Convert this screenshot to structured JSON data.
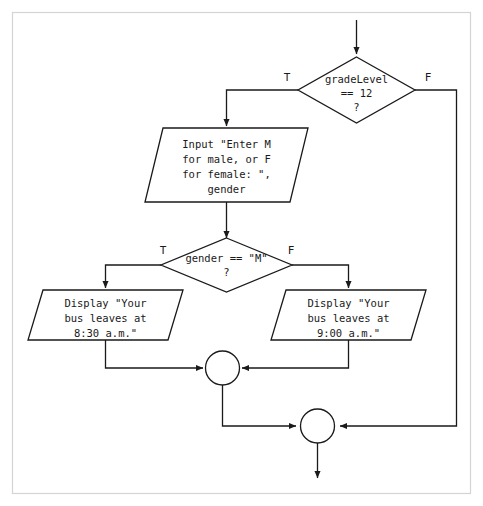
{
  "diagram": {
    "type": "flowchart",
    "frame": {
      "visible": true,
      "color": "#d4d4d4"
    },
    "colors": {
      "stroke": "#1a1a1a",
      "fill": "#ffffff",
      "frame": "#d4d4d4"
    },
    "nodes": [
      {
        "id": "entry-arrow",
        "kind": "arrow",
        "label": ""
      },
      {
        "id": "decision-grade-level",
        "kind": "decision",
        "lines": [
          "gradeLevel",
          "==  12",
          "?"
        ]
      },
      {
        "id": "input-gender",
        "kind": "input-output",
        "lines": [
          "Input \"Enter M",
          "for male, or F",
          "for female: \",",
          "gender"
        ]
      },
      {
        "id": "decision-gender",
        "kind": "decision",
        "lines": [
          "gender == \"M\"",
          "?"
        ]
      },
      {
        "id": "display-830",
        "kind": "input-output",
        "lines": [
          "Display \"Your",
          "bus leaves at",
          "8:30 a.m.\""
        ]
      },
      {
        "id": "display-900",
        "kind": "input-output",
        "lines": [
          "Display \"Your",
          "bus leaves at",
          "9:00 a.m.\""
        ]
      },
      {
        "id": "merge-connector-inner",
        "kind": "connector",
        "label": ""
      },
      {
        "id": "merge-connector-outer",
        "kind": "connector",
        "label": ""
      },
      {
        "id": "exit-arrow",
        "kind": "arrow",
        "label": ""
      }
    ],
    "branch_labels": {
      "grade_level_true": "T",
      "grade_level_false": "F",
      "gender_true": "T",
      "gender_false": "F"
    },
    "edges": [
      {
        "from": "entry-arrow",
        "to": "decision-grade-level",
        "label": ""
      },
      {
        "from": "decision-grade-level",
        "to": "input-gender",
        "label": "T"
      },
      {
        "from": "decision-grade-level",
        "to": "merge-connector-outer",
        "label": "F"
      },
      {
        "from": "input-gender",
        "to": "decision-gender",
        "label": ""
      },
      {
        "from": "decision-gender",
        "to": "display-830",
        "label": "T"
      },
      {
        "from": "decision-gender",
        "to": "display-900",
        "label": "F"
      },
      {
        "from": "display-830",
        "to": "merge-connector-inner",
        "label": ""
      },
      {
        "from": "display-900",
        "to": "merge-connector-inner",
        "label": ""
      },
      {
        "from": "merge-connector-inner",
        "to": "merge-connector-outer",
        "label": ""
      },
      {
        "from": "merge-connector-outer",
        "to": "exit-arrow",
        "label": ""
      }
    ]
  }
}
